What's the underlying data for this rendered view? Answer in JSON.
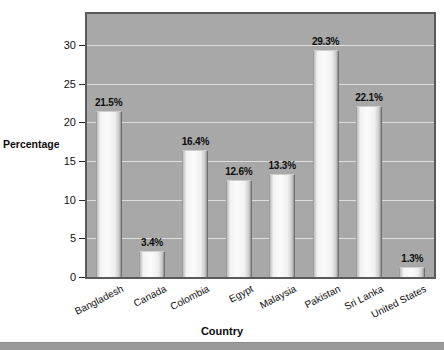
{
  "chart_data": {
    "type": "bar",
    "title": "",
    "subtitle": "",
    "xlabel": "Country",
    "ylabel": "Percentage",
    "categories": [
      "Bangladesh",
      "Canada",
      "Colombia",
      "Egypt",
      "Malaysia",
      "Pakistan",
      "Sri Lanka",
      "United States"
    ],
    "values": [
      21.5,
      3.4,
      16.4,
      12.6,
      13.3,
      29.3,
      22.1,
      1.3
    ],
    "value_labels": [
      "21.5%",
      "3.4%",
      "16.4%",
      "12.6%",
      "13.3%",
      "29.3%",
      "22.1%",
      "1.3%"
    ],
    "ylim": [
      0,
      34
    ],
    "yticks": [
      0,
      5,
      10,
      15,
      20,
      25,
      30
    ],
    "ytick_labels": [
      "0",
      "5",
      "10",
      "15",
      "20",
      "25",
      "30"
    ],
    "grid": true,
    "grid_axis": "y",
    "legend": false,
    "legend_position": "none",
    "series": [
      {
        "name": "Percentage",
        "values": [
          21.5,
          3.4,
          16.4,
          12.6,
          13.3,
          29.3,
          22.1,
          1.3
        ]
      }
    ]
  },
  "colors": {
    "plot_background": "#a8a8a8",
    "plot_border": "#5a5a5a",
    "gridline": "#e8e8e8",
    "bar_fill_light": "#fbfbfb",
    "bar_fill_shadow": "#8f8f8f",
    "text": "#0d0d0d",
    "bottom_rule": "#9a9a9a"
  }
}
